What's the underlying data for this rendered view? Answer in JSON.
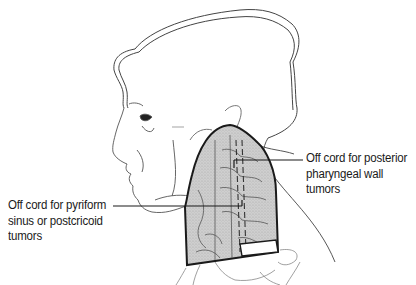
{
  "figure": {
    "field_fill": "#c8c8c8",
    "outline_color": "#1a1a1a",
    "sketch_color": "#6a6a6a"
  },
  "annotations": {
    "right": {
      "lines": [
        "Off cord for posterior",
        "pharyngeal wall",
        "tumors"
      ]
    },
    "left": {
      "lines": [
        "Off cord for pyriform",
        "sinus or postcricoid",
        "tumors"
      ]
    }
  }
}
